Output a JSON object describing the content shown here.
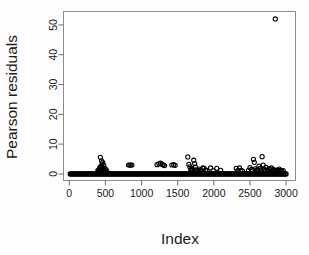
{
  "chart_data": {
    "type": "scatter",
    "title": "",
    "xlabel": "Index",
    "ylabel": "Pearson residuals",
    "xlim": [
      -80,
      3130
    ],
    "ylim": [
      -2.2,
      54.5
    ],
    "xticks": [
      0,
      500,
      1000,
      1500,
      2000,
      2500,
      3000
    ],
    "xticklabels": [
      "0",
      "500",
      "1000",
      "1500",
      "2000",
      "2500",
      "3000"
    ],
    "yticks": [
      0,
      10,
      20,
      30,
      40,
      50
    ],
    "yticklabels": [
      "0",
      "10",
      "20",
      "30",
      "40",
      "50"
    ],
    "grid": false,
    "legend": null,
    "marker": "open-circle",
    "marker_color": "#000000",
    "n_points": 3000,
    "note": "Dense overplotted band of residuals at approximately y=0 across the full index range, with sparse positive outliers and one extreme outlier near index 2850 at residual 52.",
    "outlier": {
      "x": 2850,
      "y": 52.0
    },
    "points": [
      [
        12,
        0.0
      ],
      [
        28,
        0.0
      ],
      [
        44,
        0.0
      ],
      [
        60,
        0.0
      ],
      [
        76,
        0.0
      ],
      [
        92,
        0.0
      ],
      [
        108,
        0.0
      ],
      [
        124,
        0.0
      ],
      [
        140,
        0.0
      ],
      [
        156,
        0.0
      ],
      [
        172,
        0.0
      ],
      [
        188,
        0.0
      ],
      [
        204,
        0.0
      ],
      [
        220,
        0.0
      ],
      [
        236,
        0.0
      ],
      [
        252,
        0.0
      ],
      [
        268,
        0.0
      ],
      [
        284,
        0.0
      ],
      [
        300,
        0.0
      ],
      [
        316,
        0.0
      ],
      [
        332,
        0.0
      ],
      [
        348,
        0.0
      ],
      [
        364,
        0.0
      ],
      [
        380,
        0.0
      ],
      [
        396,
        0.0
      ],
      [
        412,
        0.0
      ],
      [
        428,
        0.0
      ],
      [
        444,
        0.0
      ],
      [
        460,
        0.0
      ],
      [
        476,
        0.0
      ],
      [
        492,
        0.0
      ],
      [
        508,
        0.0
      ],
      [
        524,
        0.0
      ],
      [
        540,
        0.0
      ],
      [
        556,
        0.0
      ],
      [
        572,
        0.0
      ],
      [
        588,
        0.0
      ],
      [
        604,
        0.0
      ],
      [
        620,
        0.0
      ],
      [
        636,
        0.0
      ],
      [
        652,
        0.0
      ],
      [
        668,
        0.0
      ],
      [
        684,
        0.0
      ],
      [
        700,
        0.0
      ],
      [
        716,
        0.0
      ],
      [
        732,
        0.0
      ],
      [
        748,
        0.0
      ],
      [
        764,
        0.0
      ],
      [
        780,
        0.0
      ],
      [
        796,
        0.0
      ],
      [
        812,
        0.0
      ],
      [
        828,
        0.0
      ],
      [
        844,
        0.0
      ],
      [
        860,
        0.0
      ],
      [
        876,
        0.0
      ],
      [
        892,
        0.0
      ],
      [
        908,
        0.0
      ],
      [
        924,
        0.0
      ],
      [
        940,
        0.0
      ],
      [
        956,
        0.0
      ],
      [
        972,
        0.0
      ],
      [
        988,
        0.0
      ],
      [
        1004,
        0.0
      ],
      [
        1020,
        0.0
      ],
      [
        1036,
        0.0
      ],
      [
        1052,
        0.0
      ],
      [
        1068,
        0.0
      ],
      [
        1084,
        0.0
      ],
      [
        1100,
        0.0
      ],
      [
        1116,
        0.0
      ],
      [
        1132,
        0.0
      ],
      [
        1148,
        0.0
      ],
      [
        1164,
        0.0
      ],
      [
        1180,
        0.0
      ],
      [
        1196,
        0.0
      ],
      [
        1212,
        0.0
      ],
      [
        1228,
        0.0
      ],
      [
        1244,
        0.0
      ],
      [
        1260,
        0.0
      ],
      [
        1276,
        0.0
      ],
      [
        1292,
        0.0
      ],
      [
        1308,
        0.0
      ],
      [
        1324,
        0.0
      ],
      [
        1340,
        0.0
      ],
      [
        1356,
        0.0
      ],
      [
        1372,
        0.0
      ],
      [
        1388,
        0.0
      ],
      [
        1404,
        0.0
      ],
      [
        1420,
        0.0
      ],
      [
        1436,
        0.0
      ],
      [
        1452,
        0.0
      ],
      [
        1468,
        0.0
      ],
      [
        1484,
        0.0
      ],
      [
        1500,
        0.0
      ],
      [
        1516,
        0.0
      ],
      [
        1532,
        0.0
      ],
      [
        1548,
        0.0
      ],
      [
        1564,
        0.0
      ],
      [
        1580,
        0.0
      ],
      [
        1596,
        0.0
      ],
      [
        1612,
        0.0
      ],
      [
        1628,
        0.0
      ],
      [
        1644,
        0.0
      ],
      [
        1660,
        0.0
      ],
      [
        1676,
        0.0
      ],
      [
        1692,
        0.0
      ],
      [
        1708,
        0.0
      ],
      [
        1724,
        0.0
      ],
      [
        1740,
        0.0
      ],
      [
        1756,
        0.0
      ],
      [
        1772,
        0.0
      ],
      [
        1788,
        0.0
      ],
      [
        1804,
        0.0
      ],
      [
        1820,
        0.0
      ],
      [
        1836,
        0.0
      ],
      [
        1852,
        0.0
      ],
      [
        1868,
        0.0
      ],
      [
        1884,
        0.0
      ],
      [
        1900,
        0.0
      ],
      [
        1916,
        0.0
      ],
      [
        1932,
        0.0
      ],
      [
        1948,
        0.0
      ],
      [
        1964,
        0.0
      ],
      [
        1980,
        0.0
      ],
      [
        1996,
        0.0
      ],
      [
        2012,
        0.0
      ],
      [
        2028,
        0.0
      ],
      [
        2044,
        0.0
      ],
      [
        2060,
        0.0
      ],
      [
        2076,
        0.0
      ],
      [
        2092,
        0.0
      ],
      [
        2108,
        0.0
      ],
      [
        2124,
        0.0
      ],
      [
        2140,
        0.0
      ],
      [
        2156,
        0.0
      ],
      [
        2172,
        0.0
      ],
      [
        2188,
        0.0
      ],
      [
        2204,
        0.0
      ],
      [
        2220,
        0.0
      ],
      [
        2236,
        0.0
      ],
      [
        2252,
        0.0
      ],
      [
        2268,
        0.0
      ],
      [
        2284,
        0.0
      ],
      [
        2300,
        0.0
      ],
      [
        2316,
        0.0
      ],
      [
        2332,
        0.0
      ],
      [
        2348,
        0.0
      ],
      [
        2364,
        0.0
      ],
      [
        2380,
        0.0
      ],
      [
        2396,
        0.0
      ],
      [
        2412,
        0.0
      ],
      [
        2428,
        0.0
      ],
      [
        2444,
        0.0
      ],
      [
        2460,
        0.0
      ],
      [
        2476,
        0.0
      ],
      [
        2492,
        0.0
      ],
      [
        2508,
        0.0
      ],
      [
        2524,
        0.0
      ],
      [
        2540,
        0.0
      ],
      [
        2556,
        0.0
      ],
      [
        2572,
        0.0
      ],
      [
        2588,
        0.0
      ],
      [
        2604,
        0.0
      ],
      [
        2620,
        0.0
      ],
      [
        2636,
        0.0
      ],
      [
        2652,
        0.0
      ],
      [
        2668,
        0.0
      ],
      [
        2684,
        0.0
      ],
      [
        2700,
        0.0
      ],
      [
        2716,
        0.0
      ],
      [
        2732,
        0.0
      ],
      [
        2748,
        0.0
      ],
      [
        2764,
        0.0
      ],
      [
        2780,
        0.0
      ],
      [
        2796,
        0.0
      ],
      [
        2812,
        0.0
      ],
      [
        2828,
        0.0
      ],
      [
        2844,
        0.0
      ],
      [
        2860,
        0.0
      ],
      [
        2876,
        0.0
      ],
      [
        2892,
        0.0
      ],
      [
        2908,
        0.0
      ],
      [
        2924,
        0.0
      ],
      [
        2940,
        0.0
      ],
      [
        2956,
        0.0
      ],
      [
        2972,
        0.0
      ],
      [
        2988,
        0.0
      ],
      [
        3000,
        0.0
      ],
      [
        395,
        1.1
      ],
      [
        405,
        0.9
      ],
      [
        412,
        1.5
      ],
      [
        418,
        1.2
      ],
      [
        424,
        2.2
      ],
      [
        430,
        1.7
      ],
      [
        436,
        1.0
      ],
      [
        442,
        2.6
      ],
      [
        448,
        1.4
      ],
      [
        455,
        3.3
      ],
      [
        462,
        2.0
      ],
      [
        470,
        1.3
      ],
      [
        478,
        2.9
      ],
      [
        486,
        1.1
      ],
      [
        494,
        1.8
      ],
      [
        430,
        5.6
      ],
      [
        462,
        3.9
      ],
      [
        447,
        4.4
      ],
      [
        500,
        1.0
      ],
      [
        510,
        1.4
      ],
      [
        520,
        0.9
      ],
      [
        820,
        3.0
      ],
      [
        838,
        3.0
      ],
      [
        852,
        3.0
      ],
      [
        866,
        3.0
      ],
      [
        1215,
        3.1
      ],
      [
        1240,
        3.4
      ],
      [
        1262,
        3.6
      ],
      [
        1285,
        3.2
      ],
      [
        1300,
        3.0
      ],
      [
        1318,
        2.8
      ],
      [
        1420,
        3.0
      ],
      [
        1445,
        3.1
      ],
      [
        1465,
        2.9
      ],
      [
        1640,
        5.7
      ],
      [
        1655,
        3.2
      ],
      [
        1668,
        2.4
      ],
      [
        1682,
        1.5
      ],
      [
        1690,
        1.1
      ],
      [
        1700,
        1.8
      ],
      [
        1712,
        1.3
      ],
      [
        1722,
        4.6
      ],
      [
        1735,
        3.5
      ],
      [
        1745,
        2.3
      ],
      [
        1755,
        1.4
      ],
      [
        1768,
        1.0
      ],
      [
        1782,
        1.2
      ],
      [
        1795,
        1.6
      ],
      [
        1812,
        1.1
      ],
      [
        1830,
        1.0
      ],
      [
        1848,
        2.0
      ],
      [
        1865,
        1.9
      ],
      [
        1885,
        1.3
      ],
      [
        1905,
        1.2
      ],
      [
        1955,
        2.0
      ],
      [
        1990,
        1.1
      ],
      [
        2040,
        1.9
      ],
      [
        2095,
        1.2
      ],
      [
        2310,
        1.9
      ],
      [
        2330,
        1.1
      ],
      [
        2355,
        2.0
      ],
      [
        2375,
        1.2
      ],
      [
        2395,
        1.0
      ],
      [
        2480,
        1.2
      ],
      [
        2500,
        2.1
      ],
      [
        2520,
        1.5
      ],
      [
        2535,
        1.1
      ],
      [
        2548,
        4.9
      ],
      [
        2560,
        3.9
      ],
      [
        2572,
        1.7
      ],
      [
        2585,
        1.3
      ],
      [
        2598,
        1.0
      ],
      [
        2610,
        1.4
      ],
      [
        2625,
        2.6
      ],
      [
        2640,
        1.9
      ],
      [
        2655,
        1.2
      ],
      [
        2668,
        5.8
      ],
      [
        2682,
        3.0
      ],
      [
        2695,
        1.6
      ],
      [
        2708,
        1.1
      ],
      [
        2722,
        2.2
      ],
      [
        2738,
        1.3
      ],
      [
        2752,
        1.0
      ],
      [
        2766,
        1.8
      ],
      [
        2780,
        1.4
      ],
      [
        2795,
        2.0
      ],
      [
        2810,
        1.1
      ],
      [
        2825,
        1.5
      ],
      [
        2840,
        1.2
      ],
      [
        2858,
        1.0
      ],
      [
        2875,
        1.3
      ],
      [
        2890,
        1.1
      ],
      [
        2905,
        1.6
      ],
      [
        2920,
        1.2
      ],
      [
        2940,
        1.0
      ],
      [
        2960,
        1.1
      ],
      [
        2850,
        52.0
      ]
    ]
  },
  "axes": {
    "y_title": "Pearson residuals",
    "x_title": "Index"
  }
}
